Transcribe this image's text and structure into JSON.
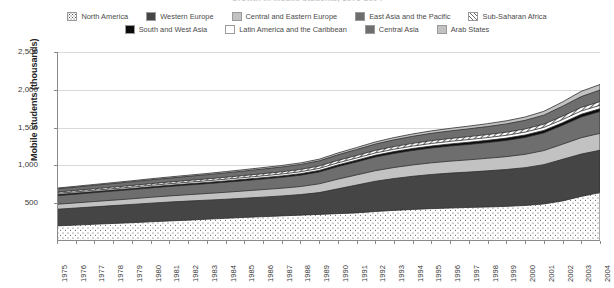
{
  "chart_title": "Growth in mobile students, 1975-2004",
  "axis": {
    "ylabel": "Mobile students (thousands)",
    "yticks": [
      "0",
      "500",
      "1,000",
      "1,500",
      "2,000",
      "2,500"
    ],
    "ylim": [
      0,
      2500
    ],
    "xticks": [
      "1975",
      "1976",
      "1977",
      "1978",
      "1979",
      "1980",
      "1981",
      "1982",
      "1983",
      "1984",
      "1985",
      "1986",
      "1987",
      "1988",
      "1989",
      "1990",
      "1991",
      "1992",
      "1993",
      "1994",
      "1995",
      "1996",
      "1997",
      "1998",
      "1999",
      "2000",
      "2001",
      "2002",
      "2003",
      "2004"
    ]
  },
  "legend": {
    "row1": [
      {
        "label": "North America",
        "swatch": "sw-dots",
        "color": "#ffffff"
      },
      {
        "label": "Western Europe",
        "swatch": "sw-dkgray",
        "color": "#454545"
      },
      {
        "label": "Central and Eastern Europe",
        "swatch": "sw-ltgray",
        "color": "#c2c2c2"
      },
      {
        "label": "East Asia and the Pacific",
        "swatch": "sw-midgray",
        "color": "#6e6e6e"
      },
      {
        "label": "Sub-Saharan Africa",
        "swatch": "sw-hatch",
        "color": "#ffffff"
      }
    ],
    "row2": [
      {
        "label": "South and West Asia",
        "swatch": "sw-black",
        "color": "#0b0b0b"
      },
      {
        "label": "Latin America and the Caribbean",
        "swatch": "sw-white",
        "color": "#ffffff"
      },
      {
        "label": "Central Asia",
        "swatch": "sw-gray2",
        "color": "#6e6e6e"
      },
      {
        "label": "Arab States",
        "swatch": "sw-paleg",
        "color": "#c2c2c2"
      }
    ]
  },
  "chart_data": {
    "type": "area",
    "title": "Growth in mobile students, 1975-2004",
    "xlabel": "",
    "ylabel": "Mobile students (thousands)",
    "ylim": [
      0,
      2500
    ],
    "grid": true,
    "legend_position": "top",
    "stacked": true,
    "x": [
      1975,
      1976,
      1977,
      1978,
      1979,
      1980,
      1981,
      1982,
      1983,
      1984,
      1985,
      1986,
      1987,
      1988,
      1989,
      1990,
      1991,
      1992,
      1993,
      1994,
      1995,
      1996,
      1997,
      1998,
      1999,
      2000,
      2001,
      2002,
      2003,
      2004
    ],
    "series": [
      {
        "name": "North America",
        "fill": "dots",
        "values": [
          200,
          210,
          222,
          232,
          242,
          254,
          265,
          276,
          288,
          300,
          312,
          322,
          332,
          342,
          352,
          362,
          372,
          390,
          405,
          418,
          428,
          436,
          444,
          450,
          458,
          470,
          490,
          530,
          590,
          640
        ]
      },
      {
        "name": "Western Europe",
        "fill": "dark-gray",
        "values": [
          420,
          436,
          452,
          468,
          484,
          500,
          515,
          528,
          540,
          552,
          566,
          580,
          596,
          614,
          640,
          690,
          740,
          790,
          826,
          856,
          880,
          898,
          912,
          928,
          946,
          970,
          1010,
          1080,
          1150,
          1200
        ]
      },
      {
        "name": "Central and Eastern Europe",
        "fill": "light-gray",
        "values": [
          486,
          504,
          522,
          540,
          558,
          578,
          596,
          612,
          628,
          644,
          662,
          680,
          698,
          720,
          756,
          818,
          874,
          930,
          972,
          1006,
          1034,
          1056,
          1074,
          1094,
          1116,
          1146,
          1196,
          1280,
          1366,
          1424
        ]
      },
      {
        "name": "East Asia and the Pacific",
        "fill": "mid-gray",
        "values": [
          600,
          620,
          640,
          660,
          680,
          702,
          722,
          740,
          758,
          778,
          798,
          820,
          842,
          870,
          912,
          984,
          1046,
          1110,
          1158,
          1198,
          1230,
          1256,
          1278,
          1302,
          1330,
          1370,
          1430,
          1530,
          1640,
          1712
        ]
      },
      {
        "name": "South and West Asia",
        "fill": "black",
        "values": [
          614,
          634,
          654,
          675,
          695,
          717,
          738,
          757,
          775,
          795,
          816,
          838,
          861,
          890,
          933,
          1006,
          1069,
          1134,
          1183,
          1224,
          1257,
          1284,
          1307,
          1332,
          1361,
          1402,
          1463,
          1565,
          1677,
          1750
        ]
      },
      {
        "name": "Latin America and the Caribbean",
        "fill": "white",
        "values": [
          630,
          650,
          671,
          692,
          713,
          736,
          757,
          777,
          796,
          817,
          839,
          862,
          886,
          916,
          960,
          1034,
          1098,
          1164,
          1214,
          1256,
          1290,
          1318,
          1342,
          1368,
          1398,
          1440,
          1502,
          1606,
          1720,
          1794
        ]
      },
      {
        "name": "Sub-Saharan Africa",
        "fill": "hatch",
        "values": [
          648,
          669,
          691,
          713,
          735,
          758,
          780,
          801,
          821,
          843,
          866,
          890,
          915,
          946,
          991,
          1066,
          1131,
          1198,
          1249,
          1292,
          1327,
          1356,
          1381,
          1408,
          1439,
          1482,
          1545,
          1651,
          1767,
          1843
        ]
      },
      {
        "name": "Central Asia",
        "fill": "gray2",
        "values": [
          690,
          713,
          737,
          760,
          784,
          809,
          832,
          855,
          877,
          901,
          926,
          952,
          979,
          1012,
          1060,
          1140,
          1210,
          1282,
          1338,
          1385,
          1424,
          1456,
          1484,
          1514,
          1549,
          1596,
          1665,
          1782,
          1910,
          1996
        ]
      },
      {
        "name": "Arab States",
        "fill": "pale-gray",
        "values": [
          700,
          724,
          748,
          772,
          797,
          823,
          847,
          870,
          893,
          918,
          944,
          971,
          999,
          1033,
          1082,
          1164,
          1236,
          1310,
          1368,
          1416,
          1457,
          1490,
          1520,
          1552,
          1590,
          1640,
          1715,
          1840,
          1980,
          2070
        ]
      }
    ],
    "total_top": [
      760,
      786,
      812,
      838,
      866,
      894,
      921,
      946,
      972,
      999,
      1028,
      1058,
      1089,
      1127,
      1181,
      1272,
      1352,
      1434,
      1498,
      1552,
      1598,
      1636,
      1670,
      1706,
      1750,
      1808,
      1895,
      2040,
      2200,
      2300
    ]
  }
}
